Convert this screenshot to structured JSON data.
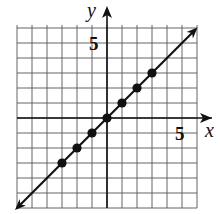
{
  "chart_data": {
    "type": "scatter",
    "title": "",
    "xlabel": "x",
    "ylabel": "y",
    "xlim": [
      -6,
      6
    ],
    "ylim": [
      -6,
      6
    ],
    "grid": true,
    "tick_labels": {
      "x": [
        "5"
      ],
      "y": [
        "5"
      ]
    },
    "line": {
      "equation": "y = x",
      "arrows": true
    },
    "series": [
      {
        "name": "points",
        "x": [
          -3,
          -2,
          -1,
          0,
          1,
          2,
          3
        ],
        "y": [
          -3,
          -2,
          -1,
          0,
          1,
          2,
          3
        ]
      }
    ]
  },
  "labels": {
    "x_axis": "x",
    "y_axis": "y",
    "x_tick": "5",
    "y_tick": "5"
  }
}
